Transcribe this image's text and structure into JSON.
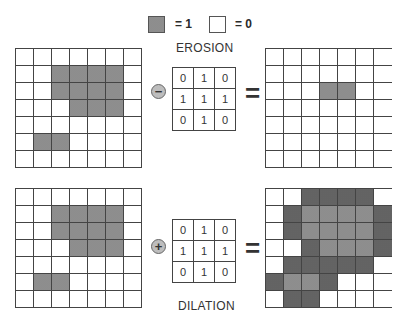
{
  "legend": {
    "on_label": "= 1",
    "off_label": "= 0"
  },
  "colors": {
    "on": "#9a9a9a",
    "dilated_added": "#6f6f6f",
    "off": "#ffffff",
    "line": "#444444"
  },
  "erosion": {
    "title": "EROSION",
    "operator_symbol": "−",
    "equals": "=",
    "input_grid": [
      [
        0,
        0,
        0,
        0,
        0,
        0,
        0
      ],
      [
        0,
        0,
        1,
        1,
        1,
        1,
        0
      ],
      [
        0,
        0,
        1,
        1,
        1,
        1,
        0
      ],
      [
        0,
        0,
        0,
        1,
        1,
        1,
        0
      ],
      [
        0,
        0,
        0,
        0,
        0,
        0,
        0
      ],
      [
        0,
        1,
        1,
        0,
        0,
        0,
        0
      ],
      [
        0,
        0,
        0,
        0,
        0,
        0,
        0
      ]
    ],
    "kernel": [
      [
        "0",
        "1",
        "0"
      ],
      [
        "1",
        "1",
        "1"
      ],
      [
        "0",
        "1",
        "0"
      ]
    ],
    "output_grid": [
      [
        0,
        0,
        0,
        0,
        0,
        0,
        0
      ],
      [
        0,
        0,
        0,
        0,
        0,
        0,
        0
      ],
      [
        0,
        0,
        0,
        1,
        1,
        0,
        0
      ],
      [
        0,
        0,
        0,
        0,
        0,
        0,
        0
      ],
      [
        0,
        0,
        0,
        0,
        0,
        0,
        0
      ],
      [
        0,
        0,
        0,
        0,
        0,
        0,
        0
      ],
      [
        0,
        0,
        0,
        0,
        0,
        0,
        0
      ]
    ]
  },
  "dilation": {
    "title": "DILATION",
    "operator_symbol": "+",
    "equals": "=",
    "input_grid": [
      [
        0,
        0,
        0,
        0,
        0,
        0,
        0
      ],
      [
        0,
        0,
        1,
        1,
        1,
        1,
        0
      ],
      [
        0,
        0,
        1,
        1,
        1,
        1,
        0
      ],
      [
        0,
        0,
        0,
        1,
        1,
        1,
        0
      ],
      [
        0,
        0,
        0,
        0,
        0,
        0,
        0
      ],
      [
        0,
        1,
        1,
        0,
        0,
        0,
        0
      ],
      [
        0,
        0,
        0,
        0,
        0,
        0,
        0
      ]
    ],
    "kernel": [
      [
        "0",
        "1",
        "0"
      ],
      [
        "1",
        "1",
        "1"
      ],
      [
        "0",
        "1",
        "0"
      ]
    ],
    "output_grid_note": "1 = original pixel, 2 = pixel added by dilation",
    "output_grid": [
      [
        0,
        0,
        2,
        2,
        2,
        2,
        0
      ],
      [
        0,
        2,
        1,
        1,
        1,
        1,
        2
      ],
      [
        0,
        2,
        1,
        1,
        1,
        1,
        2
      ],
      [
        0,
        0,
        2,
        1,
        1,
        1,
        2
      ],
      [
        0,
        2,
        2,
        2,
        2,
        2,
        0
      ],
      [
        2,
        1,
        1,
        2,
        0,
        0,
        0
      ],
      [
        0,
        2,
        2,
        0,
        0,
        0,
        0
      ]
    ]
  }
}
